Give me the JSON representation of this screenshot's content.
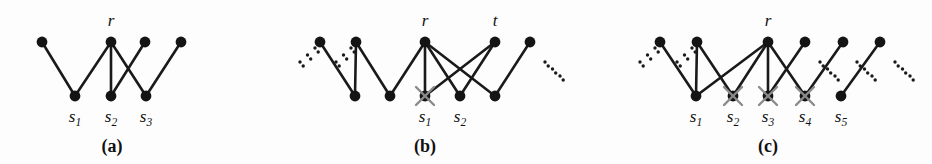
{
  "figure": {
    "type": "graph-diagram",
    "background": "#fdfdfd",
    "node_color": "#141414",
    "edge_color": "#1a1a1a",
    "cross_color": "#8a8a8a",
    "panels": [
      {
        "id": "a",
        "caption": "(a)",
        "caption_x": 112,
        "caption_y": 152,
        "top_nodes": [
          {
            "name": "a-top-1",
            "x": 42,
            "y": 42,
            "label": null
          },
          {
            "name": "a-top-r",
            "x": 111,
            "y": 42,
            "label": "r"
          },
          {
            "name": "a-top-3",
            "x": 145,
            "y": 42,
            "label": null
          },
          {
            "name": "a-top-4",
            "x": 181,
            "y": 42,
            "label": null
          }
        ],
        "bottom_nodes": [
          {
            "name": "a-bot-s1",
            "x": 75,
            "y": 96,
            "label": "s",
            "sub": "1",
            "crossed": false
          },
          {
            "name": "a-bot-s2",
            "x": 111,
            "y": 96,
            "label": "s",
            "sub": "2",
            "crossed": false
          },
          {
            "name": "a-bot-s3",
            "x": 146,
            "y": 96,
            "label": "s",
            "sub": "3",
            "crossed": false
          }
        ],
        "edges": [
          [
            42,
            42,
            75,
            96
          ],
          [
            111,
            42,
            75,
            96
          ],
          [
            111,
            42,
            111,
            96
          ],
          [
            111,
            42,
            146,
            96
          ],
          [
            145,
            42,
            111,
            96
          ],
          [
            181,
            42,
            146,
            96
          ]
        ],
        "ellipses": [],
        "label_r_x": 111,
        "label_r_y": 26
      },
      {
        "id": "b",
        "caption": "(b)",
        "caption_x": 425,
        "caption_y": 152,
        "top_nodes": [
          {
            "name": "b-top-1",
            "x": 320,
            "y": 42,
            "label": null
          },
          {
            "name": "b-top-2",
            "x": 356,
            "y": 42,
            "label": null
          },
          {
            "name": "b-top-r",
            "x": 425,
            "y": 42,
            "label": "r"
          },
          {
            "name": "b-top-t",
            "x": 495,
            "y": 42,
            "label": "t"
          },
          {
            "name": "b-top-5",
            "x": 530,
            "y": 42,
            "label": null
          }
        ],
        "bottom_nodes": [
          {
            "name": "b-bot-1",
            "x": 355,
            "y": 96,
            "label": null,
            "crossed": false
          },
          {
            "name": "b-bot-2",
            "x": 390,
            "y": 96,
            "label": null,
            "crossed": false
          },
          {
            "name": "b-bot-s1",
            "x": 425,
            "y": 96,
            "label": "s",
            "sub": "1",
            "crossed": true
          },
          {
            "name": "b-bot-s2",
            "x": 460,
            "y": 96,
            "label": "s",
            "sub": "2",
            "crossed": false
          },
          {
            "name": "b-bot-5",
            "x": 495,
            "y": 96,
            "label": null,
            "crossed": false
          }
        ],
        "edges": [
          [
            320,
            42,
            355,
            96
          ],
          [
            356,
            42,
            355,
            96
          ],
          [
            356,
            42,
            390,
            96
          ],
          [
            425,
            42,
            390,
            96
          ],
          [
            425,
            42,
            425,
            96
          ],
          [
            425,
            42,
            460,
            96
          ],
          [
            425,
            42,
            495,
            96
          ],
          [
            495,
            42,
            460,
            96
          ],
          [
            495,
            42,
            425,
            96
          ],
          [
            530,
            42,
            495,
            96
          ]
        ],
        "ellipses": [
          {
            "name": "b-ellipsis-left",
            "x": 300,
            "y": 62,
            "dir": "up-right"
          },
          {
            "name": "b-ellipsis-mid",
            "x": 336,
            "y": 62,
            "dir": "up-right"
          },
          {
            "name": "b-ellipsis-right",
            "x": 545,
            "y": 62,
            "dir": "down-right"
          }
        ],
        "label_r_x": 425,
        "label_r_y": 26,
        "label_t_x": 495,
        "label_t_y": 26
      },
      {
        "id": "c",
        "caption": "(c)",
        "caption_x": 768,
        "caption_y": 152,
        "top_nodes": [
          {
            "name": "c-top-1",
            "x": 660,
            "y": 42,
            "label": null
          },
          {
            "name": "c-top-2",
            "x": 697,
            "y": 42,
            "label": null
          },
          {
            "name": "c-top-r",
            "x": 768,
            "y": 42,
            "label": "r"
          },
          {
            "name": "c-top-4",
            "x": 805,
            "y": 42,
            "label": null
          },
          {
            "name": "c-top-5",
            "x": 843,
            "y": 42,
            "label": null
          },
          {
            "name": "c-top-6",
            "x": 880,
            "y": 42,
            "label": null
          }
        ],
        "bottom_nodes": [
          {
            "name": "c-bot-s1",
            "x": 696,
            "y": 96,
            "label": "s",
            "sub": "1",
            "crossed": false
          },
          {
            "name": "c-bot-s2",
            "x": 733,
            "y": 96,
            "label": "s",
            "sub": "2",
            "crossed": true
          },
          {
            "name": "c-bot-s3",
            "x": 768,
            "y": 96,
            "label": "s",
            "sub": "3",
            "crossed": true
          },
          {
            "name": "c-bot-s4",
            "x": 805,
            "y": 96,
            "label": "s",
            "sub": "4",
            "crossed": true
          },
          {
            "name": "c-bot-s5",
            "x": 841,
            "y": 96,
            "label": "s",
            "sub": "5",
            "crossed": false
          }
        ],
        "edges": [
          [
            660,
            42,
            696,
            96
          ],
          [
            697,
            42,
            696,
            96
          ],
          [
            697,
            42,
            733,
            96
          ],
          [
            768,
            42,
            696,
            96
          ],
          [
            768,
            42,
            733,
            96
          ],
          [
            768,
            42,
            768,
            96
          ],
          [
            768,
            42,
            805,
            96
          ],
          [
            805,
            42,
            768,
            96
          ],
          [
            843,
            42,
            805,
            96
          ],
          [
            880,
            42,
            841,
            96
          ]
        ],
        "ellipses": [
          {
            "name": "c-ellipsis-1",
            "x": 640,
            "y": 62,
            "dir": "up-right"
          },
          {
            "name": "c-ellipsis-2",
            "x": 677,
            "y": 62,
            "dir": "up-right"
          },
          {
            "name": "c-ellipsis-3",
            "x": 820,
            "y": 62,
            "dir": "down-right"
          },
          {
            "name": "c-ellipsis-4",
            "x": 857,
            "y": 62,
            "dir": "down-right"
          },
          {
            "name": "c-ellipsis-5",
            "x": 895,
            "y": 62,
            "dir": "down-right"
          }
        ],
        "label_r_x": 768,
        "label_r_y": 26
      }
    ]
  }
}
